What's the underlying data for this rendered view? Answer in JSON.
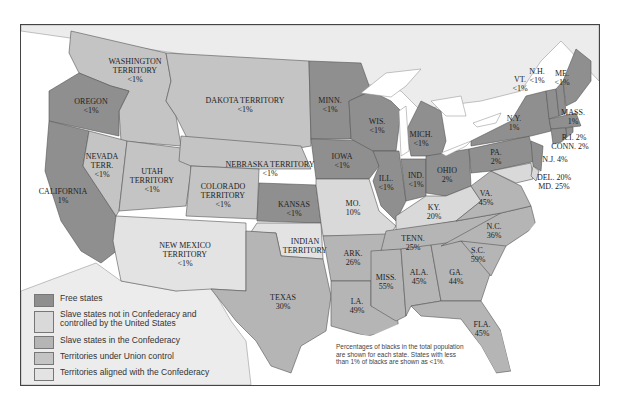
{
  "colors": {
    "free": "#8f8f8f",
    "slave_union": "#d9d9d9",
    "slave_confed": "#b5b5b5",
    "territory_union": "#c4c4c4",
    "territory_confed": "#e3e3e3",
    "foreign": "#ececec",
    "water": "#ffffff"
  },
  "legend": [
    {
      "label": "Free states",
      "color": "#8f8f8f"
    },
    {
      "label": "Slave states not in Confederacy and controlled by the United States",
      "color": "#d9d9d9"
    },
    {
      "label": "Slave states in the Confederacy",
      "color": "#b5b5b5"
    },
    {
      "label": "Territories under Union control",
      "color": "#c4c4c4"
    },
    {
      "label": "Territories aligned with the Confederacy",
      "color": "#e3e3e3"
    }
  ],
  "note": "Percentages of blacks in the total population are shown for each state. States with less than 1% of blacks are shown as <1%.",
  "regions": {
    "washington": {
      "name": "WASHINGTON TERRITORY",
      "pct": "<1%"
    },
    "oregon": {
      "name": "OREGON",
      "pct": "<1%"
    },
    "california": {
      "name": "CALIFORNIA",
      "pct": "1%"
    },
    "nevada": {
      "name": "NEVADA TERR.",
      "pct": "<1%"
    },
    "utah": {
      "name": "UTAH TERRITORY",
      "pct": "<1%"
    },
    "dakota": {
      "name": "DAKOTA TERRITORY",
      "pct": "<1%"
    },
    "nebraska": {
      "name": "NEBRASKA TERRITORY",
      "pct": "<1%"
    },
    "colorado": {
      "name": "COLORADO TERRITORY",
      "pct": "<1%"
    },
    "kansas": {
      "name": "KANSAS",
      "pct": "<1%"
    },
    "newmexico": {
      "name": "NEW MEXICO TERRITORY",
      "pct": "<1%"
    },
    "indian": {
      "name": "INDIAN TERRITORY",
      "pct": ""
    },
    "texas": {
      "name": "TEXAS",
      "pct": "30%"
    },
    "minn": {
      "name": "MINN.",
      "pct": "<1%"
    },
    "iowa": {
      "name": "IOWA",
      "pct": "<1%"
    },
    "wis": {
      "name": "WIS.",
      "pct": "<1%"
    },
    "mich": {
      "name": "MICH.",
      "pct": "<1%"
    },
    "ill": {
      "name": "ILL.",
      "pct": "<1%"
    },
    "ind": {
      "name": "IND.",
      "pct": "<1%"
    },
    "ohio": {
      "name": "OHIO",
      "pct": "2%"
    },
    "mo": {
      "name": "MO.",
      "pct": "10%"
    },
    "ky": {
      "name": "KY.",
      "pct": "20%"
    },
    "ark": {
      "name": "ARK.",
      "pct": "26%"
    },
    "la": {
      "name": "LA.",
      "pct": "49%"
    },
    "tenn": {
      "name": "TENN.",
      "pct": "25%"
    },
    "miss": {
      "name": "MISS.",
      "pct": "55%"
    },
    "ala": {
      "name": "ALA.",
      "pct": "45%"
    },
    "ga": {
      "name": "GA.",
      "pct": "44%"
    },
    "fla": {
      "name": "FLA.",
      "pct": "45%"
    },
    "sc": {
      "name": "S.C.",
      "pct": "59%"
    },
    "nc": {
      "name": "N.C.",
      "pct": "36%"
    },
    "va": {
      "name": "VA.",
      "pct": "45%"
    },
    "pa": {
      "name": "PA.",
      "pct": "2%"
    },
    "ny": {
      "name": "N.Y.",
      "pct": "1%"
    },
    "vt": {
      "name": "VT.",
      "pct": "<1%"
    },
    "nh": {
      "name": "N.H.",
      "pct": "<1%"
    },
    "me": {
      "name": "ME.",
      "pct": "<1%"
    },
    "mass": {
      "name": "MASS.",
      "pct": "1%"
    },
    "ri": {
      "name": "R.I. 2%",
      "pct": ""
    },
    "conn": {
      "name": "CONN. 2%",
      "pct": ""
    },
    "nj": {
      "name": "N.J. 4%",
      "pct": ""
    },
    "del": {
      "name": "DEL. 20%",
      "pct": ""
    },
    "md": {
      "name": "MD. 25%",
      "pct": ""
    }
  }
}
